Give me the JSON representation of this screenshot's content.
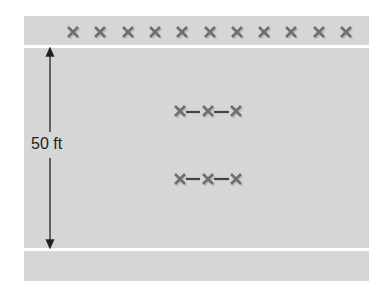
{
  "diagram": {
    "dimension_label": "50 ft",
    "top_row_marker_count": 11,
    "cluster_rows": 2,
    "cluster_markers_per_row": 3,
    "colors": {
      "background": "#d6d6d6",
      "marker": "#777777",
      "arrow": "#222222",
      "divider": "#ffffff"
    }
  }
}
